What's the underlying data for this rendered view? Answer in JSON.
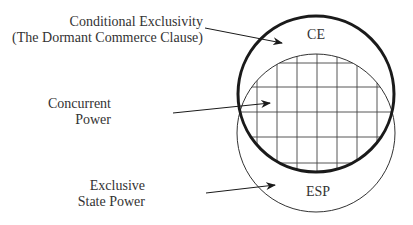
{
  "diagram": {
    "labels": {
      "conditional_exclusivity_line1": "Conditional Exclusivity",
      "conditional_exclusivity_line2": "(The Dormant Commerce Clause)",
      "concurrent_line1": "Concurrent",
      "concurrent_line2": "Power",
      "exclusive_line1": "Exclusive",
      "exclusive_line2": "State Power",
      "ce": "CE",
      "esp": "ESP"
    },
    "circles": [
      {
        "name": "CE",
        "cx": 316,
        "cy": 94,
        "r": 78,
        "stroke_width": 3,
        "color": "#1a1a1a"
      },
      {
        "name": "ESP",
        "cx": 316,
        "cy": 133,
        "r": 79,
        "stroke_width": 1,
        "color": "#333333"
      }
    ],
    "overlap_region": "Concurrent Power (grid-hatched intersection)",
    "colors": {
      "stroke": "#1a1a1a",
      "text": "#333333",
      "background": "#ffffff"
    }
  }
}
